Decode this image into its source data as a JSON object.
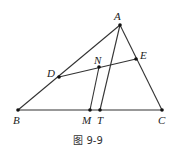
{
  "figure": {
    "caption": "图 9-9",
    "points": {
      "A": {
        "label": "A",
        "x": 120,
        "y": 25
      },
      "B": {
        "label": "B",
        "x": 18,
        "y": 110
      },
      "C": {
        "label": "C",
        "x": 162,
        "y": 110
      },
      "D": {
        "label": "D",
        "x": 59,
        "y": 77
      },
      "E": {
        "label": "E",
        "x": 136,
        "y": 59
      },
      "N": {
        "label": "N",
        "x": 99,
        "y": 67
      },
      "M": {
        "label": "M",
        "x": 90,
        "y": 110
      },
      "T": {
        "label": "T",
        "x": 100,
        "y": 110
      }
    },
    "segments": [
      "AB",
      "AC",
      "BC",
      "DE",
      "AT",
      "NM"
    ],
    "line_color": "#333333"
  }
}
